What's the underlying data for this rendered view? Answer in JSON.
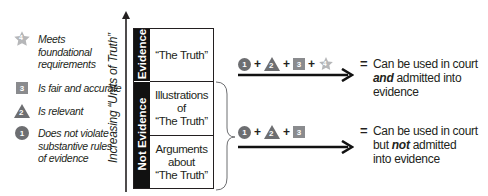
{
  "legend": [
    {
      "icon": "star-icon",
      "number": "4",
      "text": "Meets foundational requirements",
      "lines": [
        "Meets",
        "foundational",
        "requirements"
      ]
    },
    {
      "icon": "square-icon",
      "number": "3",
      "text": "Is fair and accurate",
      "lines": [
        "Is fair and accurate"
      ]
    },
    {
      "icon": "triangle-icon",
      "number": "2",
      "text": "Is relevant",
      "lines": [
        "Is relevant"
      ]
    },
    {
      "icon": "circle-icon",
      "number": "1",
      "text": "Does not violate substantive rules of evidence",
      "lines": [
        "Does not violate",
        "substantive rules",
        "of evidence"
      ]
    }
  ],
  "axis": {
    "label": "Increasing “Units of Truth”"
  },
  "table": {
    "categories": [
      {
        "label": "Evidence",
        "rows": [
          "“The Truth”"
        ]
      },
      {
        "label": "Not Evidence",
        "rows": [
          "Illustrations of “The Truth”",
          "Arguments about “The Truth”"
        ]
      }
    ],
    "row_lines": {
      "r0": [
        "“The Truth”"
      ],
      "r1": [
        "Illustrations",
        "of",
        "“The Truth”"
      ],
      "r2": [
        "Arguments",
        "about",
        "“The Truth”"
      ]
    }
  },
  "outcomes": [
    {
      "formula": [
        "1",
        "2",
        "3",
        "4"
      ],
      "plus": "+",
      "equals": "=",
      "result_lines": [
        "Can be used in court",
        "and admitted into",
        "evidence"
      ],
      "emphasis": "and",
      "line2_rest": " admitted into"
    },
    {
      "formula": [
        "1",
        "2",
        "3"
      ],
      "plus": "+",
      "equals": "=",
      "result_lines": [
        "Can be used in court",
        "but not admitted",
        "into evidence"
      ],
      "line2_pre": "but ",
      "emphasis": "not",
      "line2_rest": " admitted"
    }
  ],
  "colors": {
    "circle": "#6d6e71",
    "triangle": "#6d6e71",
    "square": "#8a8b8e",
    "star": "#b6b7b9",
    "ink": "#231f20",
    "evidence_bar": "#111111"
  }
}
